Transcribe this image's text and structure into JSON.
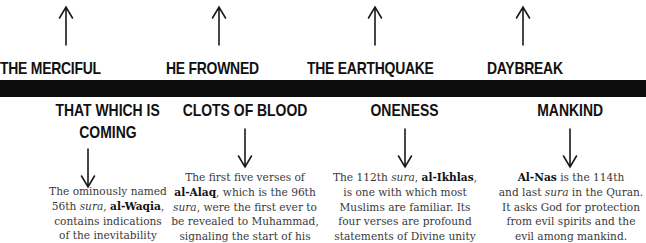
{
  "top_row": [
    {
      "title": "THE MERCIFUL",
      "arrow": "up-arrow-icon"
    },
    {
      "title": "HE FROWNED",
      "arrow": "up-arrow-icon"
    },
    {
      "title": "THE EARTHQUAKE",
      "arrow": "up-arrow-icon"
    },
    {
      "title": "DAYBREAK",
      "arrow": "up-arrow-icon"
    }
  ],
  "bottom_row": [
    {
      "title_line1": "THAT WHICH IS",
      "title_line2": "COMING",
      "arrow": "down-arrow-icon",
      "desc": [
        [
          "The ominously named"
        ],
        [
          "56th ",
          {
            "i": "sura"
          },
          ", ",
          {
            "b": "al-Waqia"
          },
          ","
        ],
        [
          "contains indications"
        ],
        [
          "of the inevitability"
        ]
      ]
    },
    {
      "title_line1": "CLOTS OF BLOOD",
      "arrow": "down-arrow-icon",
      "desc": [
        [
          "The first five verses of"
        ],
        [
          {
            "b": "al-Alaq"
          },
          ", which is the 96th"
        ],
        [
          {
            "i": "sura"
          },
          ", were the first ever to"
        ],
        [
          "be revealed to Muhammad,"
        ],
        [
          "signaling the start of his"
        ]
      ]
    },
    {
      "title_line1": "ONENESS",
      "arrow": "down-arrow-icon",
      "desc": [
        [
          "The 112th ",
          {
            "i": "sura"
          },
          ", ",
          {
            "b": "al-Ikhlas"
          },
          ","
        ],
        [
          "is one with which most"
        ],
        [
          "Muslims are familiar. Its"
        ],
        [
          "four verses are profound"
        ],
        [
          "statements of Divine unity"
        ]
      ]
    },
    {
      "title_line1": "MANKIND",
      "arrow": "down-arrow-icon",
      "desc": [
        [
          {
            "b": "Al-Nas"
          },
          " is the 114th"
        ],
        [
          "and last ",
          {
            "i": "sura"
          },
          " in the Quran."
        ],
        [
          "It asks God for protection"
        ],
        [
          "from evil spirits and the"
        ],
        [
          "evil among mankind."
        ]
      ]
    }
  ],
  "colors": {
    "bar": "#0d0d0d",
    "heading": "#111111",
    "body_text": "#3a3a3a",
    "background": "#ffffff"
  }
}
